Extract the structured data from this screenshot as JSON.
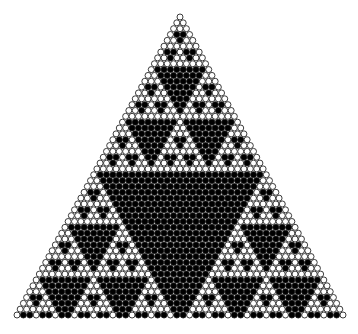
{
  "figure": {
    "title": "Pascal's Triangle Modular Circle Fractal"
  },
  "chart_data": {
    "type": "scatter",
    "title": "Pascal's Triangle Modular Circle Fractal",
    "subtitle": "",
    "xlabel": "",
    "ylabel": "",
    "grid": false,
    "legend": null,
    "annotations": [],
    "pattern": {
      "name": "pascal-mod-fractal",
      "modulus": 3,
      "fill_rule": "black-when-binomial-mod-modulus-equals-zero",
      "rows": 52,
      "row_offset": 0,
      "total_circles": 1378,
      "shape": "equilateral-triangle",
      "marker": "circle",
      "marker_diameter_px": 6.0,
      "row_pitch_px": 5.85,
      "column_pitch_px": 6.35
    },
    "geometry": {
      "apex_x": 180,
      "apex_y": 17,
      "base_left_x": 17,
      "base_right_x": 343,
      "base_y": 315,
      "width_px": 326,
      "height_px": 298
    },
    "colors": {
      "background": "#ffffff",
      "circle_fill_on": "#000000",
      "circle_fill_off": "#ffffff",
      "circle_stroke": "#1a1a1a"
    },
    "axis": {
      "xlim": [
        0,
        358
      ],
      "ylim": [
        0,
        334
      ],
      "xticks": [],
      "yticks": [],
      "xticklabels": [],
      "yticklabels": []
    },
    "series": [
      {
        "name": "divisible (black)",
        "marker_color": "#000000",
        "count": 340
      },
      {
        "name": "not divisible (white)",
        "marker_color": "#ffffff",
        "count": 1038
      }
    ]
  }
}
